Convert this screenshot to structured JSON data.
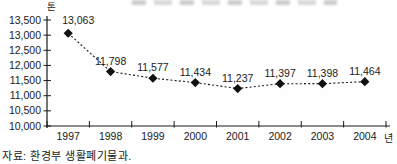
{
  "chart_data": {
    "type": "line",
    "title": "",
    "categories": [
      "1997",
      "1998",
      "1999",
      "2000",
      "2001",
      "2002",
      "2003",
      "2004"
    ],
    "values": [
      13063,
      11798,
      11577,
      11434,
      11237,
      11397,
      11398,
      11464
    ],
    "point_labels": [
      "13,063",
      "11,798",
      "11,577",
      "11,434",
      "11,237",
      "11,397",
      "11,398",
      "11,464"
    ],
    "ylim": [
      10000,
      13500
    ],
    "y_tick_step": 500,
    "y_tick_labels": [
      "10,000",
      "10,500",
      "11,000",
      "11,500",
      "12,000",
      "12,500",
      "13,000",
      "13,500"
    ],
    "y_axis_unit": "톤",
    "x_axis_unit": "년",
    "grid": false,
    "legend": "none",
    "line_style": "dotted",
    "marker": "diamond",
    "line_color": "#1a1a1a",
    "marker_color": "#111111",
    "text_color": "#1a1a1a"
  },
  "source_note": "자료: 환경부 생활폐기물과."
}
